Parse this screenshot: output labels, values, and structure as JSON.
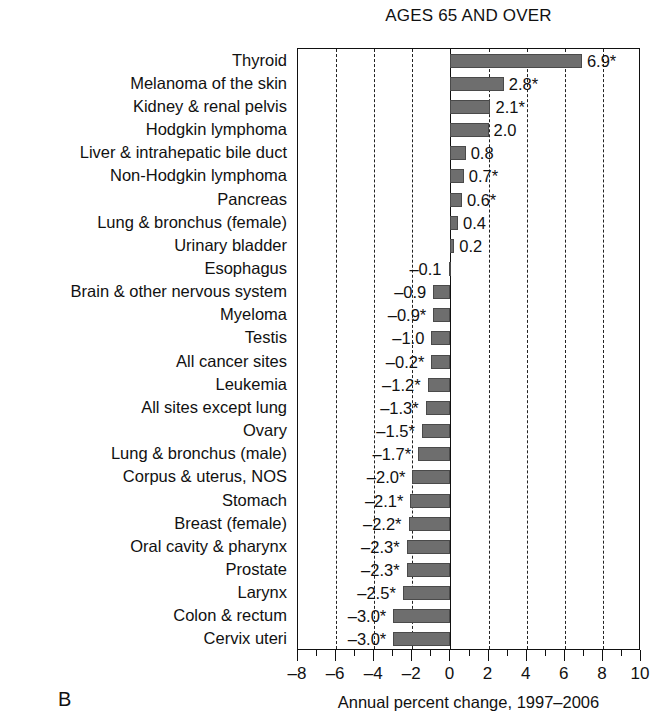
{
  "figure": {
    "title": "AGES 65 AND OVER",
    "panel_letter": "B",
    "xlabel": "Annual percent change, 1997–2006"
  },
  "axis": {
    "min": -8,
    "max": 10,
    "major_step": 2,
    "minor_step": 1,
    "tick_labels": [
      "–8",
      "–6",
      "–4",
      "–2",
      "0",
      "2",
      "4",
      "6",
      "8",
      "10"
    ],
    "tick_values": [
      -8,
      -6,
      -4,
      -2,
      0,
      2,
      4,
      6,
      8,
      10
    ],
    "gridline_values": [
      -6,
      -4,
      -2,
      2,
      4,
      6,
      8
    ],
    "zero_value": 0
  },
  "style": {
    "bar_fill": "#6e6e6e",
    "bar_stroke": "#4a4a4a",
    "frame_color": "#111111",
    "grid_color": "#222222",
    "background": "#ffffff"
  },
  "chart_data": {
    "type": "bar",
    "orientation": "horizontal",
    "title": "AGES 65 AND OVER",
    "xlabel": "Annual percent change, 1997–2006",
    "ylabel": "",
    "xlim": [
      -8,
      10
    ],
    "grid": true,
    "grid_style": "dashed-vertical",
    "legend": "none",
    "value_label_note": "* indicates the annual percent change is statistically significantly different from zero",
    "categories": [
      "Thyroid",
      "Melanoma of the skin",
      "Kidney & renal pelvis",
      "Hodgkin lymphoma",
      "Liver & intrahepatic bile duct",
      "Non-Hodgkin lymphoma",
      "Pancreas",
      "Lung & bronchus (female)",
      "Urinary bladder",
      "Esophagus",
      "Brain & other nervous system",
      "Myeloma",
      "Testis",
      "All cancer sites",
      "Leukemia",
      "All sites except lung",
      "Ovary",
      "Lung & bronchus (male)",
      "Corpus & uterus, NOS",
      "Stomach",
      "Breast (female)",
      "Oral cavity & pharynx",
      "Prostate",
      "Larynx",
      "Colon & rectum",
      "Cervix uteri"
    ],
    "values": [
      6.9,
      2.8,
      2.1,
      2.0,
      0.8,
      0.7,
      0.6,
      0.4,
      0.2,
      -0.1,
      -0.9,
      -0.9,
      -1.0,
      -0.2,
      -1.2,
      -1.3,
      -1.5,
      -1.7,
      -2.0,
      -2.1,
      -2.2,
      -2.3,
      -2.3,
      -2.5,
      -3.0,
      -3.0
    ],
    "value_labels": [
      "6.9*",
      "2.8*",
      "2.1*",
      "2.0",
      "0.8",
      "0.7*",
      "0.6*",
      "0.4",
      "0.2",
      "–0.1",
      "–0.9",
      "–0.9*",
      "–1.0",
      "–0.2*",
      "–1.2*",
      "–1.3*",
      "–1.5*",
      "–1.7*",
      "–2.0*",
      "–2.1*",
      "–2.2*",
      "–2.3*",
      "–2.3*",
      "–2.5*",
      "–3.0*",
      "–3.0*"
    ],
    "bar_lengths": [
      6.9,
      2.8,
      2.1,
      2.0,
      0.8,
      0.7,
      0.6,
      0.4,
      0.2,
      -0.1,
      -0.9,
      -0.9,
      -1.0,
      -1.0,
      -1.2,
      -1.3,
      -1.5,
      -1.7,
      -2.0,
      -2.1,
      -2.2,
      -2.3,
      -2.3,
      -2.5,
      -3.0,
      -3.0
    ],
    "significant": [
      true,
      true,
      true,
      false,
      false,
      true,
      true,
      false,
      false,
      false,
      false,
      true,
      false,
      true,
      true,
      true,
      true,
      true,
      true,
      true,
      true,
      true,
      true,
      true,
      true,
      true
    ]
  }
}
